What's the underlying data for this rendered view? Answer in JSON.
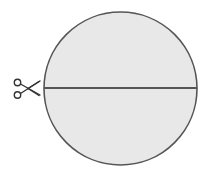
{
  "diagram": {
    "circle": {
      "cx": 120.5,
      "cy": 88.5,
      "r": 76.5,
      "fill": "#e8e8e8",
      "stroke": "#555555"
    },
    "cut_line": {
      "x1": 44,
      "y1": 88,
      "x2": 197,
      "y2": 88,
      "stroke": "#555555"
    },
    "icons": [
      "scissors-icon"
    ]
  }
}
